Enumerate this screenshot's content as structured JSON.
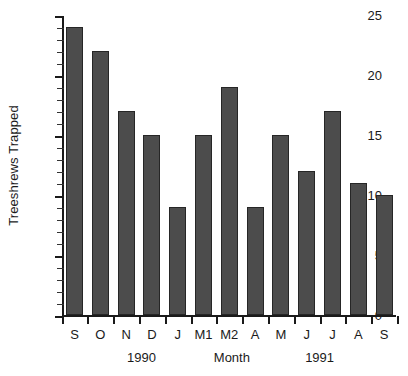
{
  "chart_data": {
    "type": "bar",
    "title": "",
    "xlabel": "Month",
    "ylabel": "Treeshrews Trapped",
    "categories": [
      "S",
      "O",
      "N",
      "D",
      "J",
      "M1",
      "M2",
      "A",
      "M",
      "J",
      "J",
      "A",
      "S"
    ],
    "values": [
      24,
      22,
      17,
      15,
      9,
      15,
      19,
      9,
      15,
      12,
      17,
      11,
      10
    ],
    "ylim": [
      0,
      25
    ],
    "ytick_labels": [
      "0",
      "5",
      "10",
      "15",
      "20",
      "25"
    ],
    "ytick_values": [
      0,
      5,
      10,
      15,
      20,
      25
    ],
    "minor_tick_step": 1,
    "grid": false,
    "legend": "none",
    "bar_color": "#4c4c4c",
    "bar_edge_color": "#262626",
    "axis_color": "#1a1a1a",
    "background_color": "#ffffff",
    "group_labels": [
      {
        "text": "1990",
        "center_category_index": 2.6
      },
      {
        "text": "Month",
        "center_category_index": 6.1
      },
      {
        "text": "1991",
        "center_category_index": 9.5
      }
    ]
  }
}
